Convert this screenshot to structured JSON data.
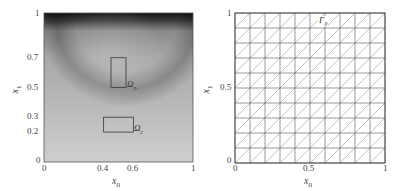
{
  "chart_data": [
    {
      "type": "heatmap",
      "title": "",
      "xlabel": "x_0",
      "ylabel": "x_1",
      "xlim": [
        0,
        1
      ],
      "ylim": [
        0,
        1
      ],
      "xticks": [
        "0",
        "0.4",
        "0.6",
        "1"
      ],
      "yticks": [
        "0",
        "0.2",
        "0.3",
        "0.5",
        "0.7",
        "1"
      ],
      "colormap": "grayscale (dark = high)",
      "grid": false,
      "annotations": [
        {
          "label": "Ω_o",
          "type": "rectangle",
          "x0_range": [
            0.45,
            0.55
          ],
          "x1_range": [
            0.5,
            0.7
          ]
        },
        {
          "label": "Ω_c",
          "type": "rectangle",
          "x0_range": [
            0.4,
            0.6
          ],
          "x1_range": [
            0.2,
            0.3
          ]
        }
      ],
      "description": "Scalar field over unit square; darkest along top boundary x1=1, with a dark curved band from upper-left region sweeping toward right side around x1≈0.5–0.9; lighter toward bottom."
    },
    {
      "type": "mesh",
      "title": "",
      "xlabel": "x_0",
      "ylabel": "x_1",
      "xlim": [
        0,
        1
      ],
      "ylim": [
        0,
        1
      ],
      "xticks": [
        "0",
        "0.5",
        "1"
      ],
      "yticks": [
        "0",
        "0.5",
        "1"
      ],
      "grid_divisions": 10,
      "element_type": "triangles (right diagonals, bottom-left to top-right)",
      "annotations": [
        {
          "label": "Γ_0",
          "position": "top boundary near x0≈0.6"
        }
      ]
    }
  ],
  "left_plot": {
    "xlabel": "x",
    "xlabel_sub": "0",
    "ylabel": "x",
    "ylabel_sub": "1",
    "xticks": [
      {
        "label": "0",
        "value": 0
      },
      {
        "label": "0.4",
        "value": 0.4
      },
      {
        "label": "0.6",
        "value": 0.6
      },
      {
        "label": "1",
        "value": 1
      }
    ],
    "yticks": [
      {
        "label": "0",
        "value": 0
      },
      {
        "label": "0.2",
        "value": 0.2
      },
      {
        "label": "0.3",
        "value": 0.3
      },
      {
        "label": "0.5",
        "value": 0.5
      },
      {
        "label": "0.7",
        "value": 0.7
      },
      {
        "label": "1",
        "value": 1
      }
    ],
    "region_o": {
      "symbol": "Ω",
      "sub": "o"
    },
    "region_c": {
      "symbol": "Ω",
      "sub": "c"
    }
  },
  "right_plot": {
    "xlabel": "x",
    "xlabel_sub": "0",
    "ylabel": "x",
    "ylabel_sub": "1",
    "xticks": [
      {
        "label": "0",
        "value": 0
      },
      {
        "label": "0.5",
        "value": 0.5
      },
      {
        "label": "1",
        "value": 1
      }
    ],
    "yticks": [
      {
        "label": "0",
        "value": 0
      },
      {
        "label": "0.5",
        "value": 0.5
      },
      {
        "label": "1",
        "value": 1
      }
    ],
    "boundary_label": {
      "symbol": "Γ",
      "sub": "0"
    }
  }
}
